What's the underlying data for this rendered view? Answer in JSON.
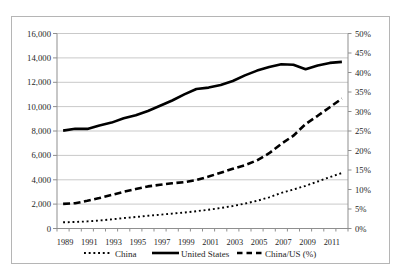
{
  "chart_data": {
    "type": "line",
    "title": "",
    "x": [
      1989,
      1990,
      1991,
      1992,
      1993,
      1994,
      1995,
      1996,
      1997,
      1998,
      1999,
      2000,
      2001,
      2002,
      2003,
      2004,
      2005,
      2006,
      2007,
      2008,
      2009,
      2010,
      2011,
      2012
    ],
    "x_tick_labels": [
      "1989",
      "1991",
      "1993",
      "1995",
      "1997",
      "1999",
      "2001",
      "2003",
      "2005",
      "2007",
      "2009",
      "2011"
    ],
    "series": [
      {
        "name": "China",
        "axis": "left",
        "style": "dotted",
        "values": [
          510,
          530,
          580,
          660,
          750,
          850,
          940,
          1040,
          1130,
          1220,
          1310,
          1420,
          1540,
          1680,
          1850,
          2040,
          2270,
          2560,
          2920,
          3200,
          3500,
          3860,
          4220,
          4550
        ]
      },
      {
        "name": "United States",
        "axis": "left",
        "style": "solid",
        "values": [
          8030,
          8180,
          8170,
          8460,
          8690,
          9040,
          9290,
          9640,
          10070,
          10500,
          11000,
          11450,
          11560,
          11770,
          12100,
          12560,
          12960,
          13260,
          13480,
          13440,
          13060,
          13380,
          13590,
          13670
        ]
      },
      {
        "name": "China/US (%)",
        "axis": "right",
        "style": "dashed",
        "values": [
          6.3,
          6.5,
          7.1,
          7.8,
          8.6,
          9.4,
          10.1,
          10.8,
          11.2,
          11.6,
          11.9,
          12.4,
          13.3,
          14.3,
          15.3,
          16.2,
          17.5,
          19.3,
          21.7,
          23.8,
          26.8,
          28.9,
          31.1,
          33.3
        ]
      }
    ],
    "left_axis": {
      "min": 0,
      "max": 16000,
      "step": 2000,
      "tick_labels": [
        "0",
        "2,000",
        "4,000",
        "6,000",
        "8,000",
        "10,000",
        "12,000",
        "14,000",
        "16,000"
      ]
    },
    "right_axis": {
      "min": 0,
      "max": 50,
      "step": 5,
      "tick_labels": [
        "0%",
        "5%",
        "10%",
        "15%",
        "20%",
        "25%",
        "30%",
        "35%",
        "40%",
        "45%",
        "50%"
      ]
    },
    "legend": [
      {
        "label": "China",
        "style": "dotted"
      },
      {
        "label": "United States",
        "style": "solid"
      },
      {
        "label": "China/US (%)",
        "style": "dashed"
      }
    ],
    "legend_position": "bottom",
    "grid": "horizontal",
    "colors": {
      "line": "#000000",
      "grid": "#c9c9c9",
      "axis": "#8f8f8f",
      "text": "#262626",
      "figure_border": "#b5b5b5",
      "background": "#ffffff"
    }
  }
}
